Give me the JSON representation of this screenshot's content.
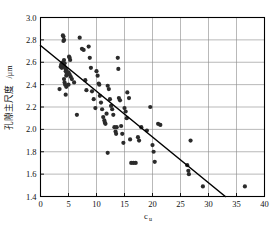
{
  "chart_data": {
    "type": "scatter",
    "title": "",
    "xlabel": "c_u",
    "xlabel_main": "c",
    "xlabel_sub": "u",
    "ylabel": "孔隙主尺度/μm",
    "ylabel_cjk": "孔隙主尺度",
    "ylabel_unit": "/μm",
    "xlim": [
      0,
      40
    ],
    "ylim": [
      1.4,
      3.0
    ],
    "xticks": [
      0,
      5,
      10,
      15,
      20,
      25,
      30,
      35,
      40
    ],
    "xtick_labels": [
      "0",
      "5",
      "10",
      "15",
      "20",
      "25",
      "30",
      "35",
      "40"
    ],
    "yticks": [
      1.4,
      1.6,
      1.8,
      2.0,
      2.2,
      2.4,
      2.6,
      2.8,
      3.0
    ],
    "ytick_labels": [
      "1.4",
      "1.6",
      "1.8",
      "2.0",
      "2.2",
      "2.4",
      "2.6",
      "2.8",
      "3.0"
    ],
    "grid": true,
    "legend": null,
    "marker_color": "#2b2b2b",
    "line_color": "#000000",
    "frame_color": "#000000",
    "grid_color": "#8a8a8a",
    "trendline": {
      "x": [
        0,
        33
      ],
      "y": [
        2.75,
        1.4
      ]
    },
    "points": [
      [
        3.4,
        2.36
      ],
      [
        3.6,
        2.56
      ],
      [
        3.7,
        2.58
      ],
      [
        3.8,
        2.55
      ],
      [
        3.9,
        2.57
      ],
      [
        4.0,
        2.6
      ],
      [
        4.0,
        2.84
      ],
      [
        4.1,
        2.83
      ],
      [
        4.1,
        2.79
      ],
      [
        4.2,
        2.8
      ],
      [
        4.2,
        2.62
      ],
      [
        4.3,
        2.59
      ],
      [
        4.3,
        2.56
      ],
      [
        4.4,
        2.55
      ],
      [
        4.5,
        2.54
      ],
      [
        4.5,
        2.52
      ],
      [
        4.6,
        2.53
      ],
      [
        4.6,
        2.48
      ],
      [
        4.7,
        2.5
      ],
      [
        4.2,
        2.45
      ],
      [
        4.3,
        2.42
      ],
      [
        4.4,
        2.4
      ],
      [
        4.5,
        2.31
      ],
      [
        4.6,
        2.38
      ],
      [
        5.0,
        2.4
      ],
      [
        5.1,
        2.65
      ],
      [
        5.2,
        2.64
      ],
      [
        5.3,
        2.62
      ],
      [
        5.0,
        2.51
      ],
      [
        5.2,
        2.49
      ],
      [
        5.4,
        2.47
      ],
      [
        5.6,
        2.45
      ],
      [
        6.0,
        2.42
      ],
      [
        6.5,
        2.13
      ],
      [
        7.0,
        2.82
      ],
      [
        7.4,
        2.72
      ],
      [
        7.7,
        2.71
      ],
      [
        8.0,
        2.44
      ],
      [
        8.2,
        2.35
      ],
      [
        8.6,
        2.74
      ],
      [
        8.8,
        2.64
      ],
      [
        9.0,
        2.55
      ],
      [
        9.2,
        2.34
      ],
      [
        9.5,
        2.27
      ],
      [
        9.8,
        2.19
      ],
      [
        10.0,
        2.52
      ],
      [
        10.2,
        2.48
      ],
      [
        10.4,
        2.41
      ],
      [
        10.5,
        2.4
      ],
      [
        10.6,
        2.3
      ],
      [
        10.8,
        2.24
      ],
      [
        11.0,
        2.18
      ],
      [
        11.2,
        2.11
      ],
      [
        11.4,
        2.08
      ],
      [
        11.5,
        2.06
      ],
      [
        11.6,
        2.05
      ],
      [
        11.8,
        2.14
      ],
      [
        12.0,
        2.39
      ],
      [
        12.2,
        2.36
      ],
      [
        12.0,
        1.79
      ],
      [
        12.4,
        2.27
      ],
      [
        12.6,
        2.21
      ],
      [
        12.8,
        2.18
      ],
      [
        13.0,
        2.13
      ],
      [
        13.2,
        2.02
      ],
      [
        13.4,
        1.98
      ],
      [
        13.5,
        1.96
      ],
      [
        13.6,
        2.02
      ],
      [
        13.8,
        2.64
      ],
      [
        13.9,
        2.54
      ],
      [
        14.0,
        2.28
      ],
      [
        14.2,
        2.26
      ],
      [
        14.4,
        2.03
      ],
      [
        14.6,
        1.96
      ],
      [
        14.8,
        1.88
      ],
      [
        15.0,
        2.19
      ],
      [
        15.2,
        2.16
      ],
      [
        15.4,
        2.1
      ],
      [
        15.5,
        2.33
      ],
      [
        15.8,
        2.28
      ],
      [
        16.0,
        1.91
      ],
      [
        16.2,
        1.7
      ],
      [
        16.6,
        1.7
      ],
      [
        17.0,
        1.7
      ],
      [
        17.4,
        1.93
      ],
      [
        17.6,
        1.9
      ],
      [
        18.0,
        2.02
      ],
      [
        19.0,
        1.99
      ],
      [
        19.6,
        2.2
      ],
      [
        20.0,
        1.86
      ],
      [
        20.2,
        1.8
      ],
      [
        20.4,
        1.71
      ],
      [
        21.0,
        2.05
      ],
      [
        21.4,
        2.04
      ],
      [
        26.2,
        1.68
      ],
      [
        26.4,
        1.63
      ],
      [
        26.5,
        1.6
      ],
      [
        26.8,
        1.9
      ],
      [
        29.0,
        1.49
      ],
      [
        36.5,
        1.49
      ]
    ]
  }
}
